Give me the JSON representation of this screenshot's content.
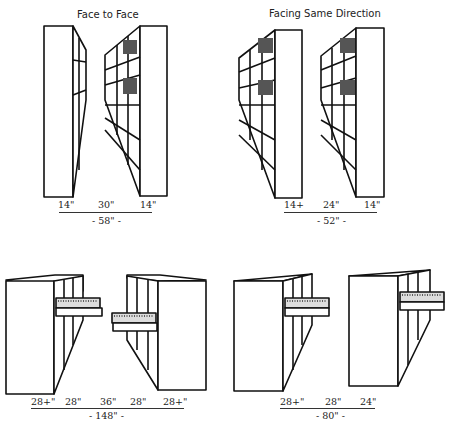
{
  "panels": [
    {
      "id": "face-to-face",
      "title": "Face to Face",
      "dims": [
        "14\"",
        "30\"",
        "14\""
      ],
      "total": "- 58\" -"
    },
    {
      "id": "facing-same-direction",
      "title": "Facing Same Direction",
      "dims": [
        "14+",
        "24\"",
        "14\""
      ],
      "total": "- 52\" -"
    },
    {
      "id": "drawers-face-to-face",
      "title": "",
      "dims": [
        "28+\"",
        "28\"",
        "36\"",
        "28\"",
        "28+\""
      ],
      "total": "- 148\" -"
    },
    {
      "id": "drawers-same-direction",
      "title": "",
      "dims": [
        "28+\"",
        "28\"",
        "24\""
      ],
      "total": "- 80\" -"
    }
  ],
  "colors": {
    "line": "#111111",
    "background": "#ffffff"
  }
}
